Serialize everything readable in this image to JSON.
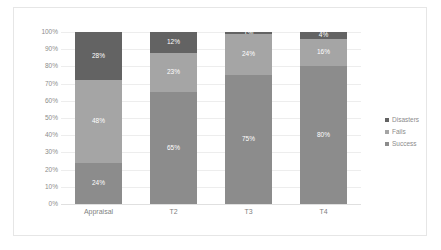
{
  "chart_data": {
    "type": "bar",
    "title": "",
    "subtitle": "",
    "xlabel": "",
    "ylabel": "",
    "stacked": true,
    "stack_mode": "percent",
    "categories": [
      "Appraisal",
      "T2",
      "T3",
      "T4"
    ],
    "series": [
      {
        "name": "Success",
        "values": [
          24,
          65,
          75,
          80
        ],
        "color": "#8c8c8c"
      },
      {
        "name": "Fails",
        "values": [
          48,
          23,
          24,
          16
        ],
        "color": "#a5a5a5"
      },
      {
        "name": "Disasters",
        "values": [
          28,
          12,
          1,
          4
        ],
        "color": "#636363"
      }
    ],
    "data_labels": [
      [
        "24%",
        "65%",
        "75%",
        "80%"
      ],
      [
        "48%",
        "23%",
        "24%",
        "16%"
      ],
      [
        "28%",
        "12%",
        "1%",
        "4%"
      ]
    ],
    "ylim": [
      0,
      100
    ],
    "ytick_labels": [
      "100%",
      "90%",
      "80%",
      "70%",
      "60%",
      "50%",
      "40%",
      "30%",
      "20%",
      "10%",
      "0%"
    ],
    "ytick_values": [
      100,
      90,
      80,
      70,
      60,
      50,
      40,
      30,
      20,
      10,
      0
    ],
    "grid": true,
    "legend_position": "right",
    "legend_entries": [
      {
        "label": "Disasters",
        "color": "#636363"
      },
      {
        "label": "Fails",
        "color": "#a5a5a5"
      },
      {
        "label": "Success",
        "color": "#8c8c8c"
      }
    ],
    "colors": {
      "disasters": "#636363",
      "fails": "#a5a5a5",
      "success": "#8c8c8c",
      "gridline": "#ededed",
      "axis_text": "#8c8c8c",
      "label_text": "#ffffff",
      "frame_border": "#e6e6e6",
      "background": "#ffffff"
    }
  }
}
